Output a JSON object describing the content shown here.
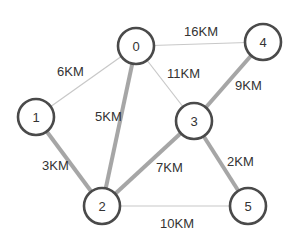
{
  "diagram": {
    "type": "weighted-undirected-graph",
    "unit": "KM",
    "nodes": [
      {
        "id": "0",
        "label": "0",
        "x": 136,
        "y": 46
      },
      {
        "id": "1",
        "label": "1",
        "x": 36,
        "y": 117
      },
      {
        "id": "2",
        "label": "2",
        "x": 102,
        "y": 206
      },
      {
        "id": "3",
        "label": "3",
        "x": 194,
        "y": 121
      },
      {
        "id": "4",
        "label": "4",
        "x": 263,
        "y": 42
      },
      {
        "id": "5",
        "label": "5",
        "x": 248,
        "y": 206
      }
    ],
    "edges": [
      {
        "from": "0",
        "to": "1",
        "label": "6KM",
        "highlighted": false
      },
      {
        "from": "0",
        "to": "4",
        "label": "16KM",
        "highlighted": false
      },
      {
        "from": "0",
        "to": "3",
        "label": "11KM",
        "highlighted": false
      },
      {
        "from": "0",
        "to": "2",
        "label": "5KM",
        "highlighted": true
      },
      {
        "from": "1",
        "to": "2",
        "label": "3KM",
        "highlighted": true
      },
      {
        "from": "3",
        "to": "4",
        "label": "9KM",
        "highlighted": true
      },
      {
        "from": "2",
        "to": "3",
        "label": "7KM",
        "highlighted": true
      },
      {
        "from": "3",
        "to": "5",
        "label": "2KM",
        "highlighted": true
      },
      {
        "from": "2",
        "to": "5",
        "label": "10KM",
        "highlighted": false
      }
    ],
    "colors": {
      "node_stroke": "#4a4a4a",
      "edge_highlighted": "#a6a6a6",
      "edge_normal": "#c8c8c8",
      "text": "#333333"
    }
  }
}
